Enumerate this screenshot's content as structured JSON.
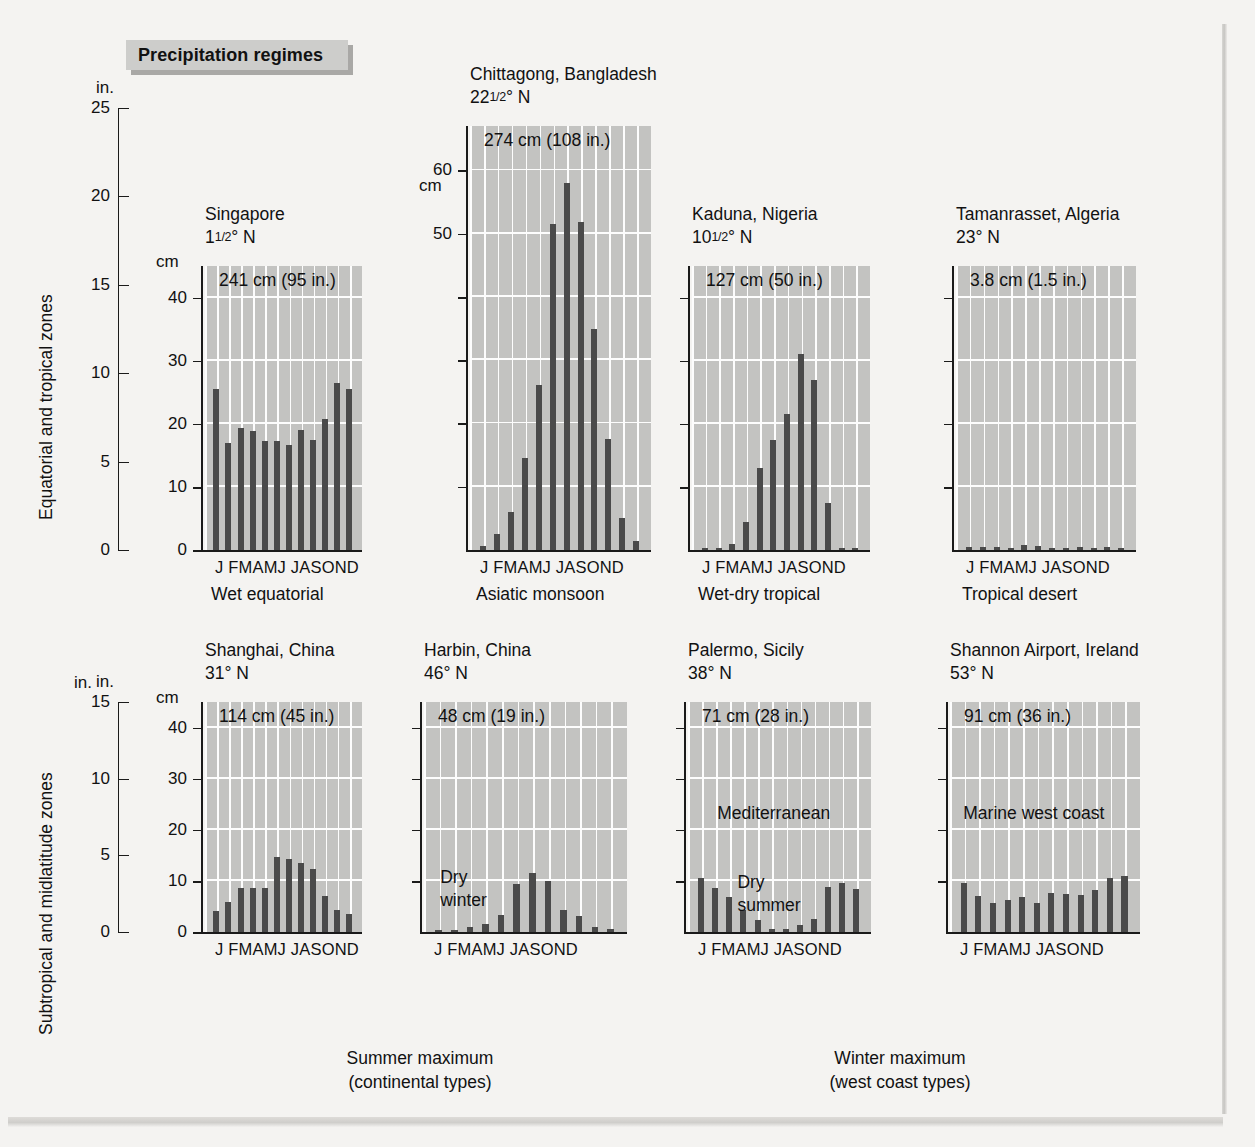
{
  "figure": {
    "banner_title": "Precipitation regimes"
  },
  "rows": [
    {
      "side_label": "Equatorial and tropical zones"
    },
    {
      "side_label": "Subtropical and midlatitude zones"
    }
  ],
  "master_axis_top": {
    "unit": "in.",
    "ticks": [
      "25",
      "20",
      "15",
      "10",
      "5",
      "0"
    ],
    "values": [
      25,
      20,
      15,
      10,
      5,
      0
    ],
    "max": 25
  },
  "master_axis_bottom": {
    "unit": "in.",
    "ticks": [
      "15",
      "10",
      "5",
      "0"
    ],
    "values": [
      15,
      10,
      5,
      0
    ],
    "max": 15
  },
  "month_labels": "J FMAMJ JASOND",
  "months": [
    "J",
    "F",
    "M",
    "A",
    "M",
    "J",
    "J",
    "A",
    "S",
    "O",
    "N",
    "D"
  ],
  "group_captions": [
    {
      "line1": "Summer maximum",
      "line2": "(continental types)"
    },
    {
      "line1": "Winter maximum",
      "line2": "(west coast types)"
    }
  ],
  "colors": {
    "page_background": "#f4f3f1",
    "plot_background": "#c3c3c1",
    "bar": "#4a4a4a",
    "gridline": "#fdfdfd",
    "axis": "#1a1a1a",
    "banner": "#cdcdcb",
    "banner_shadow": "#a9a8a6"
  },
  "chart_data": [
    {
      "type": "bar",
      "id": "singapore",
      "title": "Singapore",
      "latitude": "1¹⁄₂° N",
      "lat_int": "1",
      "lat_frac": "1/2",
      "lat_suffix": "° N",
      "annual_total": "241 cm (95 in.)",
      "annual_total_cm": 241,
      "annual_total_in": 95,
      "climate_type": "Wet equatorial",
      "categories": [
        "J",
        "F",
        "M",
        "A",
        "M",
        "J",
        "J",
        "A",
        "S",
        "O",
        "N",
        "D"
      ],
      "values": [
        25.5,
        17.0,
        19.3,
        18.8,
        17.3,
        17.2,
        16.7,
        19.0,
        17.5,
        20.7,
        26.5,
        25.5
      ],
      "unit_label": "cm",
      "ylabel": "cm",
      "yticks_cm": [
        0,
        10,
        20,
        30,
        40
      ],
      "ylim": [
        0,
        45
      ],
      "grid": true,
      "notes": []
    },
    {
      "type": "bar",
      "id": "chittagong",
      "title": "Chittagong, Bangladesh",
      "latitude": "22¹⁄₂° N",
      "lat_int": "22",
      "lat_frac": "1/2",
      "lat_suffix": "° N",
      "annual_total": "274 cm (108 in.)",
      "annual_total_cm": 274,
      "annual_total_in": 108,
      "climate_type": "Asiatic monsoon",
      "categories": [
        "J",
        "F",
        "M",
        "A",
        "M",
        "J",
        "J",
        "A",
        "S",
        "O",
        "N",
        "D"
      ],
      "values": [
        0.6,
        2.5,
        6.0,
        14.5,
        26.0,
        51.5,
        58.0,
        51.8,
        35.0,
        17.5,
        5.0,
        1.5
      ],
      "unit_label": "cm",
      "ylabel": "cm",
      "yticks_cm": [
        50,
        60
      ],
      "ylim": [
        0,
        67
      ],
      "grid": true,
      "notes": []
    },
    {
      "type": "bar",
      "id": "kaduna",
      "title": "Kaduna, Nigeria",
      "latitude": "10¹⁄₂° N",
      "lat_int": "10",
      "lat_frac": "1/2",
      "lat_suffix": "° N",
      "annual_total": "127 cm (50 in.)",
      "annual_total_cm": 127,
      "annual_total_in": 50,
      "climate_type": "Wet-dry tropical",
      "categories": [
        "J",
        "F",
        "M",
        "A",
        "M",
        "J",
        "J",
        "A",
        "S",
        "O",
        "N",
        "D"
      ],
      "values": [
        0.3,
        0.3,
        1.0,
        4.5,
        13.0,
        17.5,
        21.5,
        31.0,
        27.0,
        7.5,
        0.3,
        0.3
      ],
      "unit_label": "cm",
      "ylabel": "cm",
      "yticks_cm": [
        0,
        10,
        20,
        30,
        40
      ],
      "ylim": [
        0,
        45
      ],
      "grid": true,
      "notes": []
    },
    {
      "type": "bar",
      "id": "tamanrasset",
      "title": "Tamanrasset, Algeria",
      "latitude": "23° N",
      "lat_int": "23",
      "lat_frac": "",
      "lat_suffix": "° N",
      "annual_total": "3.8 cm (1.5 in.)",
      "annual_total_cm": 3.8,
      "annual_total_in": 1.5,
      "climate_type": "Tropical desert",
      "categories": [
        "J",
        "F",
        "M",
        "A",
        "M",
        "J",
        "J",
        "A",
        "S",
        "O",
        "N",
        "D"
      ],
      "values": [
        0.5,
        0.4,
        0.4,
        0.2,
        0.8,
        0.7,
        0.15,
        0.2,
        0.5,
        0.3,
        0.5,
        0.1
      ],
      "unit_label": "cm",
      "ylabel": "cm",
      "yticks_cm": [
        0,
        10,
        20,
        30,
        40
      ],
      "ylim": [
        0,
        45
      ],
      "grid": true,
      "notes": []
    },
    {
      "type": "bar",
      "id": "shanghai",
      "title": "Shanghai, China",
      "latitude": "31° N",
      "lat_int": "31",
      "lat_frac": "",
      "lat_suffix": "° N",
      "annual_total": "114 cm (45 in.)",
      "annual_total_cm": 114,
      "annual_total_in": 45,
      "climate_type": "",
      "categories": [
        "J",
        "F",
        "M",
        "A",
        "M",
        "J",
        "J",
        "A",
        "S",
        "O",
        "N",
        "D"
      ],
      "values": [
        4.2,
        5.8,
        8.7,
        8.7,
        8.7,
        14.7,
        14.2,
        13.6,
        12.4,
        7.0,
        4.4,
        3.5
      ],
      "unit_label": "cm",
      "ylabel": "cm",
      "yticks_cm": [
        0,
        10,
        20,
        30,
        40
      ],
      "ylim": [
        0,
        45
      ],
      "grid": true,
      "notes": []
    },
    {
      "type": "bar",
      "id": "harbin",
      "title": "Harbin, China",
      "latitude": "46° N",
      "lat_int": "46",
      "lat_frac": "",
      "lat_suffix": "° N",
      "annual_total": "48 cm (19 in.)",
      "annual_total_cm": 48,
      "annual_total_in": 19,
      "climate_type": "",
      "categories": [
        "J",
        "F",
        "M",
        "A",
        "M",
        "J",
        "J",
        "A",
        "S",
        "O",
        "N",
        "D"
      ],
      "values": [
        0.4,
        0.4,
        0.9,
        1.6,
        3.4,
        9.3,
        11.5,
        10.0,
        4.4,
        3.1,
        0.9,
        0.5
      ],
      "unit_label": "cm",
      "ylabel": "cm",
      "yticks_cm": [
        0,
        10,
        20,
        30,
        40
      ],
      "ylim": [
        0,
        45
      ],
      "grid": true,
      "notes": [
        {
          "text": "Dry\nwinter",
          "x_frac": 0.08,
          "y_cm": 13.0
        }
      ]
    },
    {
      "type": "bar",
      "id": "palermo",
      "title": "Palermo, Sicily",
      "latitude": "38° N",
      "lat_int": "38",
      "lat_frac": "",
      "lat_suffix": "° N",
      "annual_total": "71 cm (28 in.)",
      "annual_total_cm": 71,
      "annual_total_in": 28,
      "climate_type": "",
      "categories": [
        "J",
        "F",
        "M",
        "A",
        "M",
        "J",
        "J",
        "A",
        "S",
        "O",
        "N",
        "D"
      ],
      "values": [
        10.5,
        8.6,
        6.9,
        4.4,
        2.3,
        0.6,
        0.5,
        1.3,
        2.6,
        8.9,
        9.5,
        8.4
      ],
      "unit_label": "cm",
      "ylabel": "cm",
      "yticks_cm": [
        0,
        10,
        20,
        30,
        40
      ],
      "ylim": [
        0,
        45
      ],
      "grid": true,
      "notes": [
        {
          "text": "Mediterranean",
          "x_frac": 0.16,
          "y_cm": 25.5
        },
        {
          "text": "Dry\nsummer",
          "x_frac": 0.27,
          "y_cm": 12.0
        }
      ]
    },
    {
      "type": "bar",
      "id": "shannon",
      "title": "Shannon Airport, Ireland",
      "latitude": "53° N",
      "lat_int": "53",
      "lat_frac": "",
      "lat_suffix": "° N",
      "annual_total": "91 cm (36 in.)",
      "annual_total_cm": 91,
      "annual_total_in": 36,
      "climate_type": "",
      "categories": [
        "J",
        "F",
        "M",
        "A",
        "M",
        "J",
        "J",
        "A",
        "S",
        "O",
        "N",
        "D"
      ],
      "values": [
        9.5,
        7.1,
        5.6,
        6.2,
        6.8,
        5.7,
        7.7,
        7.4,
        7.3,
        8.2,
        10.5,
        10.9
      ],
      "unit_label": "cm",
      "ylabel": "cm",
      "yticks_cm": [
        0,
        10,
        20,
        30,
        40
      ],
      "ylim": [
        0,
        45
      ],
      "grid": true,
      "notes": [
        {
          "text": "Marine west coast",
          "x_frac": 0.07,
          "y_cm": 25.5
        }
      ]
    }
  ]
}
